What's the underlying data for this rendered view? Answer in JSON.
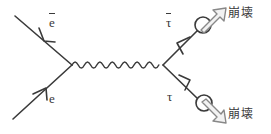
{
  "figure": {
    "name": "electron-positron-annihilation-to-tau-pair-feynman-diagram",
    "stroke_color": "#3a3a3a",
    "background_color": "#ffffff",
    "width": 271,
    "height": 134
  },
  "labels": {
    "positron": "e",
    "positron_overbar": true,
    "electron": "e",
    "antitau": "τ",
    "antitau_overbar": true,
    "tau": "τ",
    "decay_top": "崩壊",
    "decay_bottom": "崩壊"
  },
  "icons": {
    "photon_propagator": "wavy-line-icon",
    "arrowhead_positron": "arrowhead-icon",
    "arrowhead_electron": "arrowhead-icon",
    "arrowhead_antitau": "arrowhead-icon",
    "arrowhead_tau": "arrowhead-icon",
    "spin_circle_top": "circle-icon",
    "spin_circle_bottom": "circle-icon",
    "decay_arrow_top": "hollow-block-arrow-icon",
    "decay_arrow_bottom": "hollow-block-arrow-icon"
  },
  "geometry": {
    "vertex_left": {
      "x": 72,
      "y": 65
    },
    "vertex_right": {
      "x": 163,
      "y": 65
    },
    "positron_line_start": {
      "x": 15,
      "y": 16
    },
    "electron_line_start": {
      "x": 13,
      "y": 119
    },
    "antitau_line_end": {
      "x": 196,
      "y": 31
    },
    "tau_line_end": {
      "x": 198,
      "y": 98
    },
    "circle_top": {
      "cx": 203,
      "cy": 25,
      "r": 8
    },
    "circle_bottom": {
      "cx": 204,
      "cy": 103,
      "r": 8
    },
    "photon_wave_start_x": 74,
    "photon_wave_end_x": 161,
    "photon_wave_amplitude": 5,
    "photon_wave_cycles": 7
  }
}
